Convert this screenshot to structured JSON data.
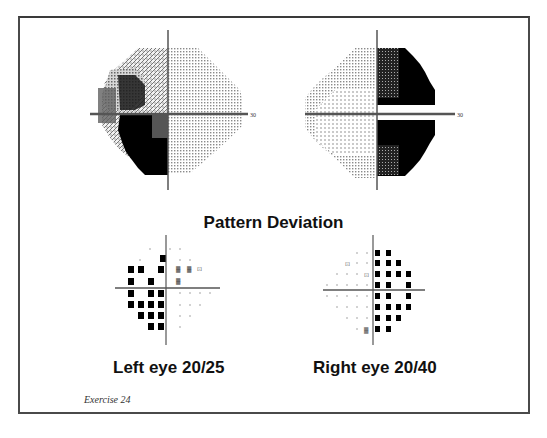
{
  "figure": {
    "title": "Pattern Deviation",
    "caption": "Exercise 24",
    "axis_extent_label": "30"
  },
  "left_eye": {
    "label": "Left eye 20/25",
    "eye": "Left",
    "visual_acuity": "20/25",
    "grayscale_defect": "Dense inferior-temporal (left hemifield, lower) quadrant defect with partial superior-temporal involvement, respecting vertical meridian",
    "pattern_deviation_defect_side": "left"
  },
  "right_eye": {
    "label": "Right eye 20/40",
    "eye": "Right",
    "visual_acuity": "20/40",
    "grayscale_defect": "Dense temporal (right hemifield) defect in upper and lower quadrants, respecting vertical meridian",
    "pattern_deviation_defect_side": "right"
  },
  "colors": {
    "frame": "#4a4a4a",
    "defect": "#000000",
    "light_pattern": "#9a9a9a",
    "text": "#111111"
  }
}
